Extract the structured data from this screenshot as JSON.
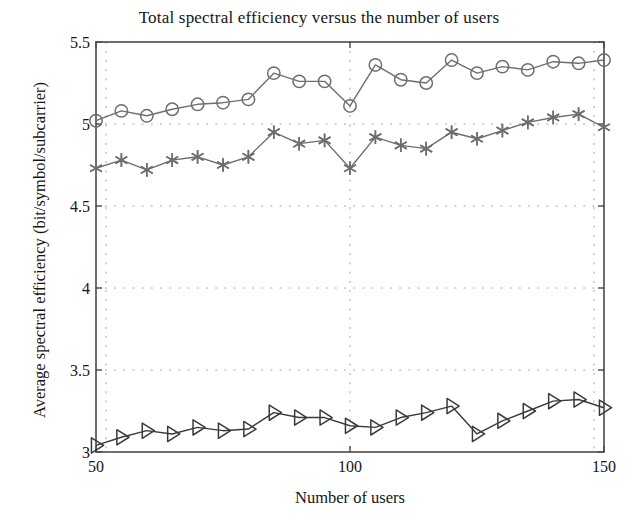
{
  "chart_data": {
    "type": "line",
    "title": "Total spectral efficiency versus the number of users",
    "xlabel": "Number of users",
    "ylabel": "Average spectral efficiency (bit/symbol/subcarrier)",
    "xlim": [
      50,
      150
    ],
    "ylim": [
      3,
      5.5
    ],
    "xticks": [
      50,
      100,
      150
    ],
    "xtick_labels": [
      "50",
      "100",
      "150"
    ],
    "yticks": [
      3,
      3.5,
      4,
      4.5,
      5,
      5.5
    ],
    "ytick_labels": [
      "3",
      "3.5",
      "4",
      "4.5",
      "5",
      "5.5"
    ],
    "grid": true,
    "grid_style": "dotted",
    "legend": null,
    "legend_position": "none",
    "x": [
      50,
      55,
      60,
      65,
      70,
      75,
      80,
      85,
      90,
      95,
      100,
      105,
      110,
      115,
      120,
      125,
      130,
      135,
      140,
      145,
      150
    ],
    "series": [
      {
        "name": "series-circle",
        "marker": "circle",
        "color": "#6e6e6e",
        "values": [
          5.02,
          5.08,
          5.05,
          5.09,
          5.12,
          5.13,
          5.15,
          5.31,
          5.26,
          5.26,
          5.11,
          5.36,
          5.27,
          5.25,
          5.39,
          5.31,
          5.35,
          5.33,
          5.38,
          5.37,
          5.39
        ]
      },
      {
        "name": "series-asterisk",
        "marker": "asterisk",
        "color": "#6e6e6e",
        "values": [
          4.73,
          4.78,
          4.72,
          4.78,
          4.8,
          4.75,
          4.8,
          4.95,
          4.88,
          4.9,
          4.73,
          4.92,
          4.87,
          4.85,
          4.95,
          4.91,
          4.96,
          5.01,
          5.04,
          5.06,
          4.98
        ]
      },
      {
        "name": "series-triangle",
        "marker": "triangle-right",
        "color": "#3a3a3a",
        "values": [
          3.04,
          3.09,
          3.13,
          3.11,
          3.15,
          3.13,
          3.14,
          3.24,
          3.21,
          3.21,
          3.16,
          3.15,
          3.21,
          3.24,
          3.28,
          3.11,
          3.19,
          3.25,
          3.31,
          3.32,
          3.27
        ]
      }
    ]
  },
  "axes": {
    "frame_color": "#4a4a4a",
    "grid_color": "#a8a8a8"
  }
}
